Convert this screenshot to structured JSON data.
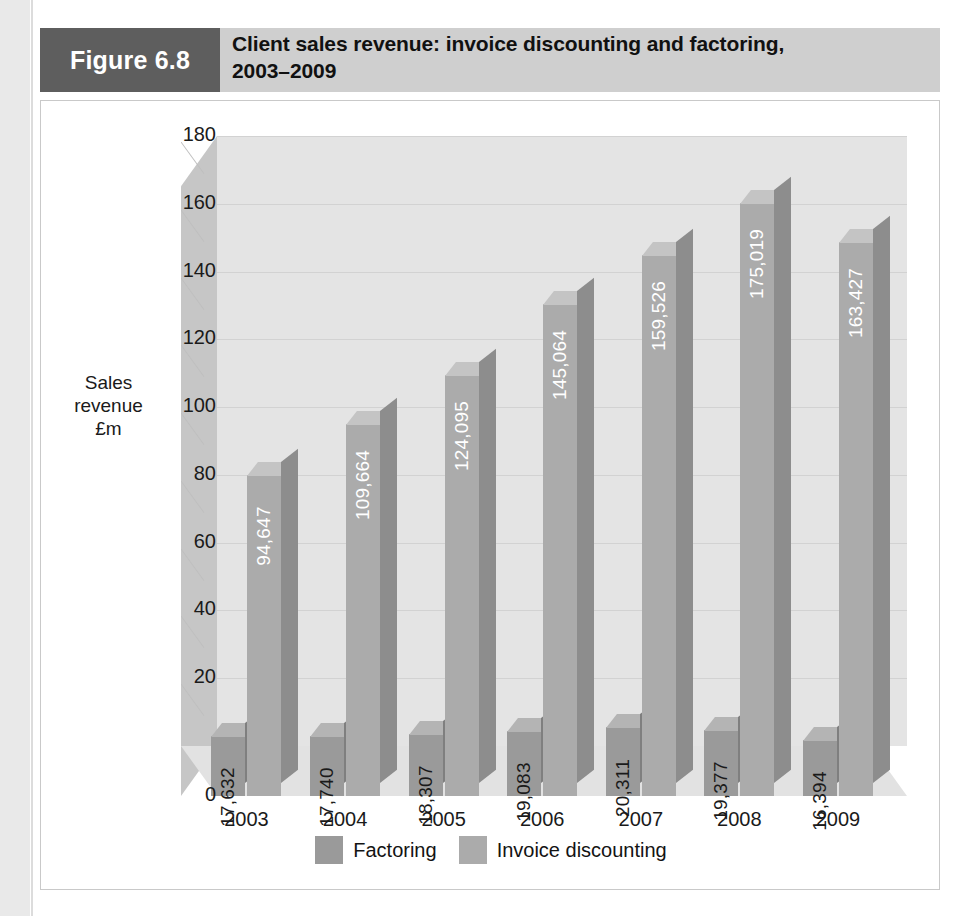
{
  "figure": {
    "tag": "Figure 6.8",
    "title_line1": "Client sales revenue: invoice discounting and factoring,",
    "title_line2": "2003–2009"
  },
  "colors": {
    "tag_background": "#5e5e5e",
    "header_background": "#cfcfcf",
    "factoring": "#9a9a9a",
    "factoring_top": "#b4b4b4",
    "factoring_side": "#7f7f7f",
    "invoice_discounting": "#ababab",
    "invoice_discounting_top": "#c4c4c4",
    "invoice_discounting_side": "#8d8d8d",
    "plot_back_wall": "#e4e4e4",
    "plot_left_wall": "#c6c6c6",
    "gridline": "#d2d2d2",
    "text": "#1a1a1a",
    "value_label_dark": "#1a1a1a",
    "value_label_light": "#ffffff"
  },
  "chart_data": {
    "type": "bar",
    "title": "Client sales revenue: invoice discounting and factoring, 2003–2009",
    "xlabel": "",
    "ylabel": "Sales revenue £m",
    "ylabel_lines": [
      "Sales",
      "revenue",
      "£m"
    ],
    "categories": [
      "2003",
      "2004",
      "2005",
      "2006",
      "2007",
      "2008",
      "2009"
    ],
    "ylim": [
      0,
      180
    ],
    "ytick_labels": [
      "0",
      "20",
      "40",
      "60",
      "80",
      "100",
      "120",
      "140",
      "160",
      "180"
    ],
    "ytick_values": [
      0,
      20,
      40,
      60,
      80,
      100,
      120,
      140,
      160,
      180
    ],
    "grid": true,
    "legend_position": "bottom",
    "value_unit": "£m",
    "note": "Data labels are printed in thousands (£m to 3 decimals implied); bar heights read against the 0–180 £m axis.",
    "series": [
      {
        "name": "Factoring",
        "color": "#9a9a9a",
        "values": [
          17.632,
          17.74,
          18.307,
          19.083,
          20.311,
          19.377,
          16.394
        ],
        "labels": [
          "17,632",
          "17,740",
          "18,307",
          "19,083",
          "20,311",
          "19,377",
          "16,394"
        ]
      },
      {
        "name": "Invoice discounting",
        "color": "#ababab",
        "values": [
          94.647,
          109.664,
          124.095,
          145.064,
          159.526,
          175.019,
          163.427
        ],
        "labels": [
          "94,647",
          "109,664",
          "124,095",
          "145,064",
          "159,526",
          "175,019",
          "163,427"
        ]
      }
    ]
  },
  "legend": {
    "items": [
      {
        "label": "Factoring",
        "color": "#9a9a9a"
      },
      {
        "label": "Invoice discounting",
        "color": "#ababab"
      }
    ]
  }
}
